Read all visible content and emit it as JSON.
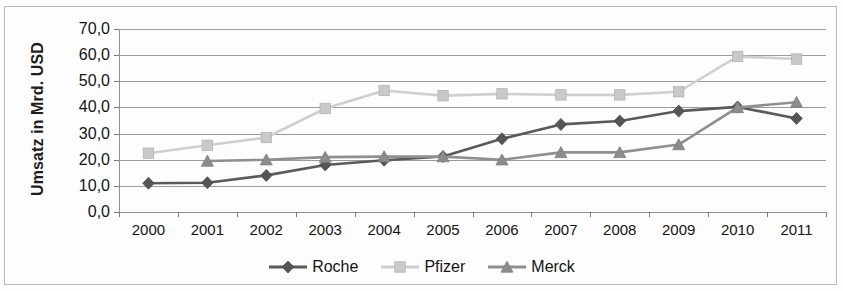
{
  "chart_data": {
    "type": "line",
    "title": "",
    "subtitle": "",
    "xlabel": "",
    "ylabel": "Umsatz in Mrd. USD",
    "categories": [
      "2000",
      "2001",
      "2002",
      "2003",
      "2004",
      "2005",
      "2006",
      "2007",
      "2008",
      "2009",
      "2010",
      "2011"
    ],
    "x": [
      2000,
      2001,
      2002,
      2003,
      2004,
      2005,
      2006,
      2007,
      2008,
      2009,
      2010,
      2011
    ],
    "ylim": [
      0,
      70
    ],
    "ytick_step": 10,
    "ytick_labels": [
      "0,0",
      "10,0",
      "20,0",
      "30,0",
      "40,0",
      "50,0",
      "60,0",
      "70,0"
    ],
    "ytick_values": [
      0,
      10,
      20,
      30,
      40,
      50,
      60,
      70
    ],
    "grid": "horizontal",
    "legend_position": "bottom-center",
    "series": [
      {
        "name": "Roche",
        "marker": "diamond",
        "color": "#555555",
        "line_color": "#5a5a5a",
        "values": [
          11.0,
          11.2,
          14.0,
          18.0,
          19.8,
          21.2,
          28.0,
          33.5,
          34.8,
          38.6,
          40.2,
          35.8
        ]
      },
      {
        "name": "Pfizer",
        "marker": "square",
        "color": "#c9c9c9",
        "line_color": "#cfcfcf",
        "values": [
          22.5,
          25.5,
          28.5,
          39.6,
          46.5,
          44.5,
          45.2,
          44.8,
          44.8,
          46.0,
          59.5,
          58.5
        ]
      },
      {
        "name": "Merck",
        "marker": "triangle",
        "color": "#8c8c8c",
        "line_color": "#8f8f8f",
        "values": [
          null,
          19.5,
          20.0,
          21.0,
          21.2,
          21.2,
          20.0,
          22.8,
          22.8,
          25.8,
          40.0,
          42.0
        ]
      }
    ]
  },
  "axis": {
    "y_title": "Umsatz in Mrd. USD"
  },
  "legend": {
    "items": [
      {
        "label": "Roche",
        "marker": "diamond-marker-icon"
      },
      {
        "label": "Pfizer",
        "marker": "square-marker-icon"
      },
      {
        "label": "Merck",
        "marker": "triangle-marker-icon"
      }
    ]
  },
  "colors": {
    "grid": "#9b9b9b",
    "axis": "#8f8f8f",
    "text": "#141414",
    "frame": "#b9b9b9"
  }
}
